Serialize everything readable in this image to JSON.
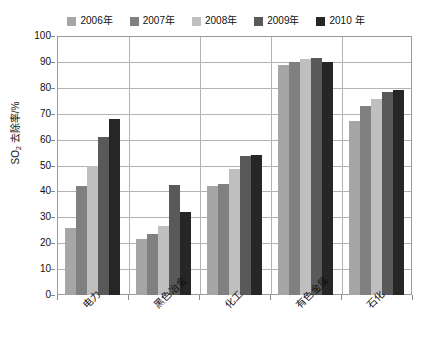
{
  "chart_data": {
    "type": "bar",
    "title": "",
    "subtitle": "",
    "xlabel": "",
    "ylabel": "SO₂ 去除率/%",
    "ylabel_base": "SO",
    "ylabel_sub": "2",
    "ylabel_rest": " 去除率/%",
    "ylim": [
      0,
      100
    ],
    "ytick_step": 10,
    "yticks": [
      "100",
      "90",
      "80",
      "70",
      "60",
      "50",
      "40",
      "30",
      "20",
      "10",
      "0"
    ],
    "grid": "horizontal-and-vertical",
    "legend_position": "top-center",
    "categories": [
      "电力",
      "黑色冶金",
      "化工",
      "有色金属",
      "石化"
    ],
    "series": [
      {
        "name": "2006年",
        "color": "#a6a6a6",
        "values": [
          26,
          21.5,
          42,
          89,
          67
        ]
      },
      {
        "name": "2007年",
        "color": "#808080",
        "values": [
          42,
          23.5,
          43,
          90,
          73
        ]
      },
      {
        "name": "2008年",
        "color": "#bfbfbf",
        "values": [
          50,
          26.5,
          48.5,
          91,
          75.5
        ]
      },
      {
        "name": "2009年",
        "color": "#595959",
        "values": [
          61,
          42.5,
          53.5,
          91.5,
          78.5
        ]
      },
      {
        "name": "2010 年",
        "color": "#262626",
        "values": [
          68,
          32,
          54,
          90,
          79
        ]
      }
    ]
  },
  "legend": {
    "items": [
      {
        "label": "2006年"
      },
      {
        "label": "2007年"
      },
      {
        "label": "2008年"
      },
      {
        "label": "2009年"
      },
      {
        "label": "2010 年"
      }
    ]
  },
  "axes": {
    "y_title": "SO₂ 去除率/%",
    "y_ticks": [
      "100",
      "90",
      "80",
      "70",
      "60",
      "50",
      "40",
      "30",
      "20",
      "10",
      "0"
    ],
    "x_categories": [
      "电力",
      "黑色冶金",
      "化工",
      "有色金属",
      "石化"
    ]
  }
}
